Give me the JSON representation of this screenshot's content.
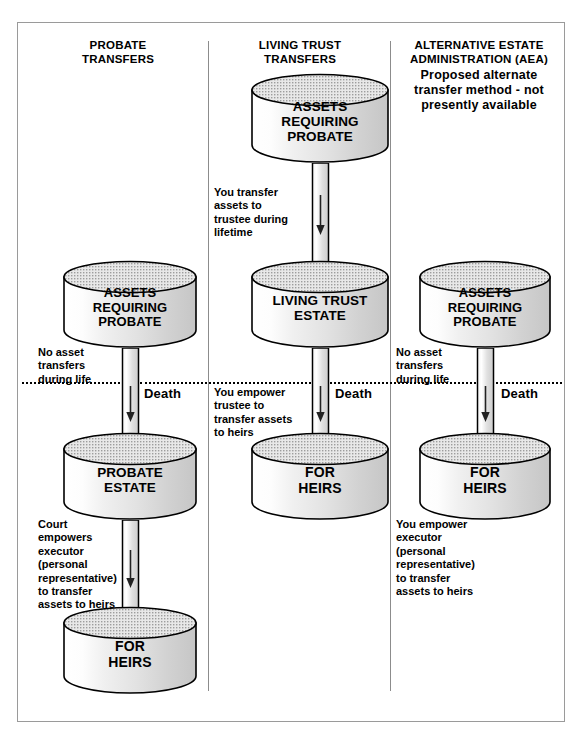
{
  "diagram": {
    "title_bar": null,
    "columns": [
      {
        "id": "probate-transfers",
        "heading_line1": "PROBATE",
        "heading_line2": "TRANSFERS",
        "subheading": null,
        "nodes": [
          {
            "id": "assets-requiring-probate-1",
            "lines": [
              "ASSETS",
              "REQUIRING",
              "PROBATE"
            ]
          },
          {
            "id": "probate-estate",
            "lines": [
              "PROBATE",
              "ESTATE"
            ]
          },
          {
            "id": "for-heirs-1",
            "lines": [
              "FOR",
              "HEIRS"
            ]
          }
        ],
        "notes": [
          {
            "id": "no-asset-transfers-1",
            "text": "No asset\ntransfers\nduring life"
          },
          {
            "id": "court-empowers-executor",
            "text": "Court\nempowers\nexecutor\n(personal\nrepresentative)\nto transfer\nassets to heirs"
          }
        ]
      },
      {
        "id": "living-trust-transfers",
        "heading_line1": "LIVING TRUST",
        "heading_line2": "TRANSFERS",
        "subheading": null,
        "nodes": [
          {
            "id": "assets-requiring-probate-2",
            "lines": [
              "ASSETS",
              "REQUIRING",
              "PROBATE"
            ]
          },
          {
            "id": "living-trust-estate",
            "lines": [
              "LIVING TRUST",
              "ESTATE"
            ]
          },
          {
            "id": "for-heirs-2",
            "lines": [
              "FOR",
              "HEIRS"
            ]
          }
        ],
        "notes": [
          {
            "id": "you-transfer-assets-to-trustee",
            "text": "You transfer\nassets to\ntrustee during\nlifetime"
          },
          {
            "id": "you-empower-trustee",
            "text": "You empower\ntrustee to\ntransfer assets\nto heirs"
          }
        ]
      },
      {
        "id": "alternative-estate-administration",
        "heading_line1": "ALTERNATIVE ESTATE",
        "heading_line2": "ADMINISTRATION (AEA)",
        "subheading": "Proposed alternate\ntransfer method - not\npresently available",
        "nodes": [
          {
            "id": "assets-requiring-probate-3",
            "lines": [
              "ASSETS",
              "REQUIRING",
              "PROBATE"
            ]
          },
          {
            "id": "for-heirs-3",
            "lines": [
              "FOR",
              "HEIRS"
            ]
          }
        ],
        "notes": [
          {
            "id": "no-asset-transfers-2",
            "text": "No asset\ntransfers\nduring life"
          },
          {
            "id": "you-empower-executor",
            "text": "You empower\nexecutor\n(personal\nrepresentative)\nto transfer\nassets to heirs"
          }
        ]
      }
    ],
    "death_line": {
      "label": "Death",
      "labels_count": 3
    },
    "colors": {
      "ink": "#000000",
      "frame_border": "#9a9a9a",
      "divider": "#8c8c8c",
      "cylinder_stroke": "#000000",
      "cylinder_top_fill": "#cfcfcf",
      "cylinder_body_light": "#ffffff",
      "cylinder_body_shade": "#c8c8c8",
      "background": "#ffffff"
    }
  }
}
